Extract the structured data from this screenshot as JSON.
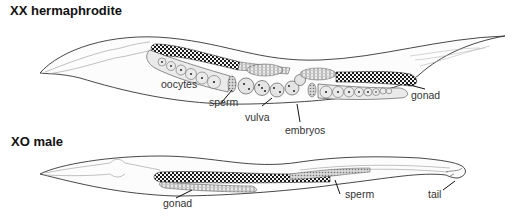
{
  "hermaphrodite": {
    "title": "XX hermaphrodite",
    "labels": {
      "oocytes": "oocytes",
      "sperm": "sperm",
      "vulva": "vulva",
      "embryos": "embryos",
      "gonad": "gonad"
    }
  },
  "male": {
    "title": "XO male",
    "labels": {
      "gonad": "gonad",
      "sperm": "sperm",
      "tail": "tail"
    }
  },
  "colors": {
    "outline": "#333333",
    "germ_dark": "#1a1a1a",
    "cell_fill": "#e6e6e6",
    "text": "#333333"
  }
}
